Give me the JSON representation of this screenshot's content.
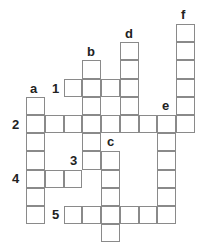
{
  "puzzle": {
    "type": "crossword",
    "grid_origin": {
      "x": 26,
      "y": 24
    },
    "cell_size": {
      "w": 18.75,
      "h": 18.2
    },
    "entries": [
      {
        "id": "1",
        "direction": "across",
        "row": 3,
        "col": 2,
        "length": 4
      },
      {
        "id": "2",
        "direction": "across",
        "row": 5,
        "col": 0,
        "length": 9
      },
      {
        "id": "3",
        "direction": "down",
        "row": 7,
        "col": 3,
        "length": 1
      },
      {
        "id": "4",
        "direction": "across",
        "row": 8,
        "col": 0,
        "length": 3
      },
      {
        "id": "5",
        "direction": "across",
        "row": 10,
        "col": 2,
        "length": 6
      },
      {
        "id": "a",
        "direction": "down",
        "row": 4,
        "col": 0,
        "length": 7
      },
      {
        "id": "b",
        "direction": "down",
        "row": 2,
        "col": 3,
        "length": 6
      },
      {
        "id": "c",
        "direction": "down",
        "row": 7,
        "col": 4,
        "length": 5
      },
      {
        "id": "d",
        "direction": "down",
        "row": 1,
        "col": 5,
        "length": 5
      },
      {
        "id": "e",
        "direction": "down",
        "row": 5,
        "col": 7,
        "length": 6
      },
      {
        "id": "f",
        "direction": "down",
        "row": 0,
        "col": 8,
        "length": 6
      }
    ],
    "labels": [
      {
        "text": "a",
        "x": 30,
        "y": 82
      },
      {
        "text": "b",
        "x": 87,
        "y": 45
      },
      {
        "text": "c",
        "x": 107,
        "y": 135
      },
      {
        "text": "d",
        "x": 125,
        "y": 27
      },
      {
        "text": "e",
        "x": 162,
        "y": 99
      },
      {
        "text": "f",
        "x": 181,
        "y": 8
      },
      {
        "text": "1",
        "x": 52,
        "y": 82
      },
      {
        "text": "2",
        "x": 12,
        "y": 118
      },
      {
        "text": "3",
        "x": 70,
        "y": 154
      },
      {
        "text": "4",
        "x": 12,
        "y": 172
      },
      {
        "text": "5",
        "x": 52,
        "y": 208
      }
    ],
    "colors": {
      "border": "#8a8a8a",
      "text": "#222222",
      "background": "#ffffff"
    }
  }
}
